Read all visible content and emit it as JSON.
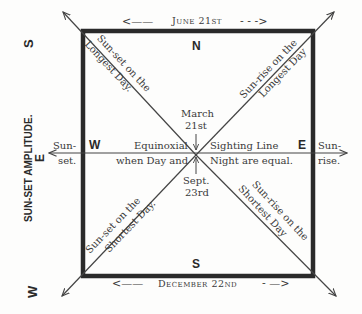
{
  "diagram": {
    "title_top": "June 21st",
    "title_bottom": "December 22nd",
    "side_label_left": "SUN-SET AMPLITUDE.",
    "left_compass": {
      "top": "S",
      "middle": "E",
      "bottom": "W"
    },
    "box_labels": {
      "north": "N",
      "south": "S",
      "west": "W",
      "east": "E"
    },
    "lines": {
      "longest_sunset": {
        "line1": "Sun-set on the",
        "line2": "Longest Day."
      },
      "longest_sunrise": {
        "line1": "Sun-rise on the",
        "line2": "Longest Day"
      },
      "shortest_sunset": {
        "line1": "Sun-set on the",
        "line2": "Shortest Day."
      },
      "shortest_sunrise": {
        "line1": "Sun-rise on the",
        "line2": "Shortest Day"
      }
    },
    "equinox": {
      "left_top": "Equinoxial",
      "left_bottom": "when Day and",
      "right_top": "Sighting Line",
      "right_bottom": "Night are equal."
    },
    "march": {
      "line1": "March",
      "line2": "21st"
    },
    "sept": {
      "line1": "Sept.",
      "line2": "23rd"
    },
    "west_end": {
      "line1": "Sun-",
      "line2": "set."
    },
    "east_end": {
      "line1": "Sun-",
      "line2": "rise."
    },
    "arrows": {
      "left": "<——",
      "right": "- - ->",
      "bottom_left": "<——",
      "bottom_right": "- —>"
    },
    "colors": {
      "ink": "#2e2e2e",
      "box": "#2a2a2a",
      "paper": "#fdfdfc"
    }
  }
}
